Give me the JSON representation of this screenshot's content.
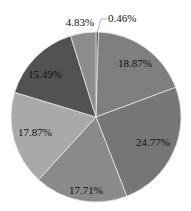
{
  "chart_data": {
    "type": "pie",
    "title": "",
    "start_angle_deg": 0,
    "direction": "clockwise",
    "center": [
      96,
      117
    ],
    "radius": 85,
    "slices": [
      {
        "label": "0.46%",
        "value": 0.46,
        "color": "#333333",
        "label_pos": [
          108,
          22
        ],
        "anchor": "start",
        "leader": true
      },
      {
        "label": "18.87%",
        "value": 18.87,
        "color": "#7f7f7f",
        "label_pos": [
          135,
          67
        ],
        "anchor": "middle",
        "leader": false
      },
      {
        "label": "24.77%",
        "value": 24.77,
        "color": "#767676",
        "label_pos": [
          153,
          146
        ],
        "anchor": "middle",
        "leader": false
      },
      {
        "label": "17.71%",
        "value": 17.71,
        "color": "#8a8a8a",
        "label_pos": [
          86,
          194
        ],
        "anchor": "middle",
        "leader": false
      },
      {
        "label": "17.87%",
        "value": 17.87,
        "color": "#a9a9a9",
        "label_pos": [
          35,
          136
        ],
        "anchor": "middle",
        "leader": false
      },
      {
        "label": "15.49%",
        "value": 15.49,
        "color": "#525252",
        "label_pos": [
          45,
          78
        ],
        "anchor": "middle",
        "leader": false
      },
      {
        "label": "4.83%",
        "value": 4.83,
        "color": "#8c8c8c",
        "label_pos": [
          80,
          26
        ],
        "anchor": "middle",
        "leader": false
      }
    ],
    "legend": null
  }
}
